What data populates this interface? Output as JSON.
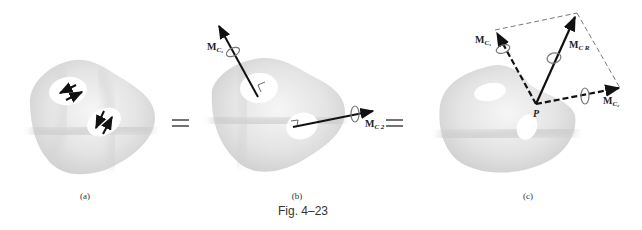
{
  "figure": {
    "caption": "Fig. 4–23",
    "equals_sign": "="
  },
  "panels": [
    {
      "id": "a",
      "label": "(a)",
      "description": "Rigid body with two couples shown as pairs of antiparallel force arrows in white patches"
    },
    {
      "id": "b",
      "label": "(b)",
      "description": "Couples represented as couple moment vectors perpendicular to their planes",
      "vectors": [
        {
          "name": "M",
          "subscript": "C1",
          "text": "M",
          "sub_text": "C₁"
        },
        {
          "name": "M",
          "subscript": "C2",
          "text": "M",
          "sub_text": "C 2"
        }
      ]
    },
    {
      "id": "c",
      "label": "(c)",
      "description": "Couple moment vectors moved to point P and added by parallelogram law to resultant",
      "point_label": "P",
      "vectors": [
        {
          "name": "M",
          "subscript": "C1",
          "text": "M",
          "sub_text": "C₁",
          "style": "dashed"
        },
        {
          "name": "M",
          "subscript": "C2",
          "text": "M",
          "sub_text": "C₂",
          "style": "dashed"
        },
        {
          "name": "M",
          "subscript": "CR",
          "text": "M",
          "sub_text": "C R",
          "style": "solid"
        }
      ]
    }
  ]
}
